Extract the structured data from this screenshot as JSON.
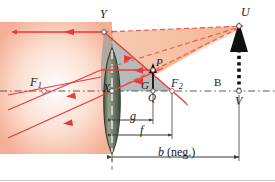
{
  "figure": {
    "type": "optics-ray-diagram",
    "colors": {
      "ray": "#e8393c",
      "ray_dashed": "#e8585a",
      "axis": "#555555",
      "lens_fill": "#7b8a74",
      "lens_edge": "#3c4a3a",
      "glow": "#f6b49a",
      "shade_gray": "#9aa0a0",
      "shade_orange": "#f0a070",
      "object_black": "#111111"
    }
  },
  "labels": {
    "Y": {
      "text": "Y",
      "x": 100,
      "y": 10,
      "italic": true
    },
    "U": {
      "text": "U",
      "x": 241,
      "y": 9,
      "italic": true
    },
    "B": {
      "text": "B",
      "x": 216,
      "y": 79,
      "italic": false
    },
    "V": {
      "text": "V",
      "x": 235,
      "y": 99,
      "italic": true
    },
    "F1": {
      "text": "F",
      "sub": "1",
      "x": 10,
      "y": 80,
      "italic": true
    },
    "F2": {
      "text": "F",
      "sub": "2",
      "x": 170,
      "y": 80,
      "italic": true
    },
    "X": {
      "text": "X",
      "x": 105,
      "y": 85,
      "italic": true
    },
    "P": {
      "text": "P",
      "x": 158,
      "y": 62,
      "italic": true
    },
    "G": {
      "text": "G",
      "x": 145,
      "y": 85,
      "italic": true
    },
    "Q": {
      "text": "Q",
      "x": 146,
      "y": 103,
      "italic": true
    },
    "g": {
      "text": "g",
      "x": 133,
      "y": 117,
      "italic": true
    },
    "f": {
      "text": "f",
      "x": 147,
      "y": 132,
      "italic": true
    },
    "b": {
      "text": "b",
      "suffix": " (neg.)",
      "x": 163,
      "y": 152,
      "italic": true
    }
  },
  "points": {
    "Y": {
      "x": 104,
      "y": 32
    },
    "U": {
      "x": 239,
      "y": 26
    },
    "V": {
      "x": 239,
      "y": 91
    },
    "X": {
      "x": 112,
      "y": 91
    },
    "F1": {
      "x": 44,
      "y": 91
    },
    "F2": {
      "x": 172,
      "y": 91
    },
    "P": {
      "x": 153,
      "y": 76
    },
    "Q": {
      "x": 153,
      "y": 91
    }
  },
  "dimensions": {
    "g": {
      "from_x": 112,
      "to_x": 153,
      "y": 120,
      "label": "g"
    },
    "f": {
      "from_x": 112,
      "to_x": 172,
      "y": 135,
      "label": "f"
    },
    "b": {
      "from_x": 112,
      "to_x": 239,
      "y": 157,
      "label": "b (neg.)"
    }
  },
  "axis": {
    "y": 91,
    "x_start": 0,
    "x_end": 275,
    "style": "dash-dot"
  },
  "lens": {
    "center_x": 112,
    "top_y": 48,
    "bottom_y": 154,
    "half_width": 11,
    "type": "biconvex"
  },
  "object": {
    "name": "B",
    "tip": "U",
    "base": "V",
    "x": 239,
    "top_y": 30,
    "bottom_y": 91,
    "style": "dotted-arrow-up"
  }
}
